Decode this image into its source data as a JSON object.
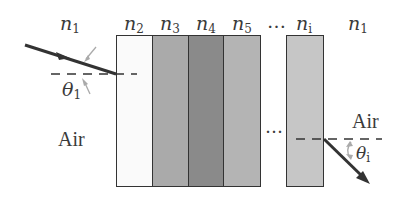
{
  "diagram": {
    "top_labels": [
      {
        "base": "n",
        "sub": "1"
      },
      {
        "base": "n",
        "sub": "2"
      },
      {
        "base": "n",
        "sub": "3"
      },
      {
        "base": "n",
        "sub": "4"
      },
      {
        "base": "n",
        "sub": "5"
      },
      {
        "base": "…",
        "sub": ""
      },
      {
        "base": "n",
        "sub": "i"
      },
      {
        "base": "n",
        "sub": "1"
      }
    ],
    "layers": [
      {
        "name": "n2",
        "color": "#fafafa"
      },
      {
        "name": "n3",
        "color": "#aaaaaa"
      },
      {
        "name": "n4",
        "color": "#8a8a8a"
      },
      {
        "name": "n5",
        "color": "#b4b4b4"
      },
      {
        "name": "ni",
        "color": "#c6c6c6"
      }
    ],
    "gap_ellipsis": "…",
    "left_medium": "Air",
    "right_medium": "Air",
    "incident_angle": {
      "base": "θ",
      "sub": "1"
    },
    "exit_angle": {
      "base": "θ",
      "sub": "i"
    }
  }
}
